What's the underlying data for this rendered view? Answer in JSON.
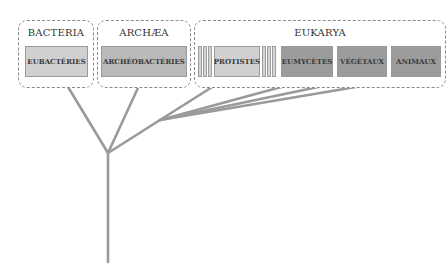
{
  "domains": {
    "bacteria": {
      "title": "BACTERIA",
      "kingdoms": [
        "EUBACTÉRIES"
      ]
    },
    "archaea": {
      "title": "ARCHÆA",
      "kingdoms": [
        "ARCHÉOBACTÉRIES"
      ]
    },
    "eukarya": {
      "title": "EUKARYA",
      "kingdoms": [
        "PROTISTES",
        "EUMYCÈTES",
        "VÉGÉTAUX",
        "ANIMAUX"
      ]
    }
  },
  "colors": {
    "line": "#999999",
    "box_border": "#8a8a8a",
    "light_fill": "#d0d0d0",
    "mid_fill": "#b9b9b9",
    "dark_fill": "#9c9c9c"
  },
  "tree": {
    "root": [
      108,
      262
    ],
    "node_main": [
      108,
      153
    ],
    "node_eukarya": [
      160,
      120
    ],
    "tips": {
      "EUBACTÉRIES": [
        62,
        77
      ],
      "ARCHÉOBACTÉRIES": [
        143,
        77
      ],
      "PROTISTES": [
        228,
        77
      ],
      "EUMYCÈTES": [
        318,
        77
      ],
      "VÉGÉTAUX": [
        366,
        77
      ],
      "ANIMAUX": [
        415,
        77
      ]
    }
  }
}
